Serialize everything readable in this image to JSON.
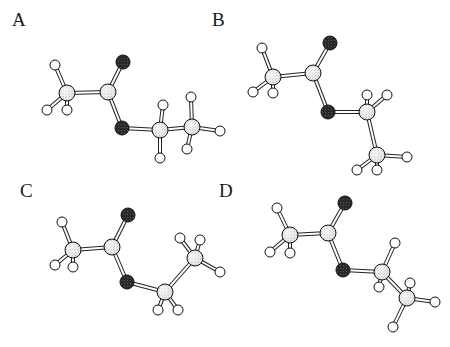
{
  "figure": {
    "colors": {
      "background": "#ffffff",
      "carbon_fill": "#e4e4e4",
      "oxygen_fill": "#222222",
      "hydrogen_fill": "#ffffff",
      "outline": "#111111",
      "bond_outline": "#222222",
      "bond_fill": "#ffffff"
    },
    "panels": [
      {
        "label": "A",
        "label_pos": [
          12,
          10
        ],
        "atoms": [
          {
            "id": "H1",
            "el": "H",
            "x": 55,
            "y": 65
          },
          {
            "id": "H2",
            "el": "H",
            "x": 47,
            "y": 110
          },
          {
            "id": "H3",
            "el": "H",
            "x": 67,
            "y": 110
          },
          {
            "id": "C1",
            "el": "C",
            "x": 67,
            "y": 93
          },
          {
            "id": "C2",
            "el": "C",
            "x": 108,
            "y": 92
          },
          {
            "id": "O1",
            "el": "O",
            "x": 123,
            "y": 62
          },
          {
            "id": "O2",
            "el": "O",
            "x": 122,
            "y": 128
          },
          {
            "id": "C3",
            "el": "C",
            "x": 160,
            "y": 130
          },
          {
            "id": "H4",
            "el": "H",
            "x": 163,
            "y": 105
          },
          {
            "id": "H5",
            "el": "H",
            "x": 160,
            "y": 158
          },
          {
            "id": "C4",
            "el": "C",
            "x": 192,
            "y": 127
          },
          {
            "id": "H6",
            "el": "H",
            "x": 191,
            "y": 97
          },
          {
            "id": "H7",
            "el": "H",
            "x": 220,
            "y": 131
          },
          {
            "id": "H8",
            "el": "H",
            "x": 187,
            "y": 149
          }
        ],
        "bonds": [
          [
            "C1",
            "H1"
          ],
          [
            "C1",
            "H2"
          ],
          [
            "C1",
            "H3"
          ],
          [
            "C1",
            "C2"
          ],
          [
            "C2",
            "O1"
          ],
          [
            "C2",
            "O2"
          ],
          [
            "O2",
            "C3"
          ],
          [
            "C3",
            "H4"
          ],
          [
            "C3",
            "H5"
          ],
          [
            "C3",
            "C4"
          ],
          [
            "C4",
            "H6"
          ],
          [
            "C4",
            "H7"
          ],
          [
            "C4",
            "H8"
          ]
        ]
      },
      {
        "label": "B",
        "label_pos": [
          212,
          10
        ],
        "atoms": [
          {
            "id": "H1",
            "el": "H",
            "x": 262,
            "y": 48
          },
          {
            "id": "H2",
            "el": "H",
            "x": 253,
            "y": 92
          },
          {
            "id": "H3",
            "el": "H",
            "x": 273,
            "y": 93
          },
          {
            "id": "C1",
            "el": "C",
            "x": 273,
            "y": 77
          },
          {
            "id": "C2",
            "el": "C",
            "x": 313,
            "y": 73
          },
          {
            "id": "O1",
            "el": "O",
            "x": 330,
            "y": 43
          },
          {
            "id": "O2",
            "el": "O",
            "x": 328,
            "y": 112
          },
          {
            "id": "H4",
            "el": "H",
            "x": 367,
            "y": 95
          },
          {
            "id": "H5",
            "el": "H",
            "x": 387,
            "y": 95
          },
          {
            "id": "C3",
            "el": "C",
            "x": 367,
            "y": 112
          },
          {
            "id": "C4",
            "el": "C",
            "x": 377,
            "y": 155
          },
          {
            "id": "H6",
            "el": "H",
            "x": 407,
            "y": 157
          },
          {
            "id": "H7",
            "el": "H",
            "x": 357,
            "y": 170
          },
          {
            "id": "H8",
            "el": "H",
            "x": 377,
            "y": 170
          }
        ],
        "bonds": [
          [
            "C1",
            "H1"
          ],
          [
            "C1",
            "H2"
          ],
          [
            "C1",
            "H3"
          ],
          [
            "C1",
            "C2"
          ],
          [
            "C2",
            "O1"
          ],
          [
            "C2",
            "O2"
          ],
          [
            "O2",
            "C3"
          ],
          [
            "C3",
            "H4"
          ],
          [
            "C3",
            "H5"
          ],
          [
            "C3",
            "C4"
          ],
          [
            "C4",
            "H6"
          ],
          [
            "C4",
            "H7"
          ],
          [
            "C4",
            "H8"
          ]
        ]
      },
      {
        "label": "C",
        "label_pos": [
          20,
          181
        ],
        "atoms": [
          {
            "id": "H1",
            "el": "H",
            "x": 62,
            "y": 222
          },
          {
            "id": "H2",
            "el": "H",
            "x": 55,
            "y": 265
          },
          {
            "id": "H3",
            "el": "H",
            "x": 73,
            "y": 267
          },
          {
            "id": "C1",
            "el": "C",
            "x": 73,
            "y": 250
          },
          {
            "id": "C2",
            "el": "C",
            "x": 112,
            "y": 247
          },
          {
            "id": "O1",
            "el": "O",
            "x": 128,
            "y": 215
          },
          {
            "id": "O2",
            "el": "O",
            "x": 127,
            "y": 282
          },
          {
            "id": "C3",
            "el": "C",
            "x": 165,
            "y": 292
          },
          {
            "id": "H4",
            "el": "H",
            "x": 158,
            "y": 310
          },
          {
            "id": "H5",
            "el": "H",
            "x": 178,
            "y": 310
          },
          {
            "id": "H6",
            "el": "H",
            "x": 180,
            "y": 238
          },
          {
            "id": "H7",
            "el": "H",
            "x": 200,
            "y": 240
          },
          {
            "id": "C4",
            "el": "C",
            "x": 195,
            "y": 258
          },
          {
            "id": "H8",
            "el": "H",
            "x": 220,
            "y": 272
          }
        ],
        "bonds": [
          [
            "C1",
            "H1"
          ],
          [
            "C1",
            "H2"
          ],
          [
            "C1",
            "H3"
          ],
          [
            "C1",
            "C2"
          ],
          [
            "C2",
            "O1"
          ],
          [
            "C2",
            "O2"
          ],
          [
            "O2",
            "C3"
          ],
          [
            "C3",
            "H4"
          ],
          [
            "C3",
            "H5"
          ],
          [
            "C3",
            "C4"
          ],
          [
            "C4",
            "H6"
          ],
          [
            "C4",
            "H7"
          ],
          [
            "C4",
            "H8"
          ]
        ]
      },
      {
        "label": "D",
        "label_pos": [
          219,
          181
        ],
        "atoms": [
          {
            "id": "H1",
            "el": "H",
            "x": 277,
            "y": 208
          },
          {
            "id": "H2",
            "el": "H",
            "x": 270,
            "y": 252
          },
          {
            "id": "H3",
            "el": "H",
            "x": 290,
            "y": 253
          },
          {
            "id": "C1",
            "el": "C",
            "x": 290,
            "y": 235
          },
          {
            "id": "C2",
            "el": "C",
            "x": 328,
            "y": 233
          },
          {
            "id": "O1",
            "el": "O",
            "x": 345,
            "y": 203
          },
          {
            "id": "O2",
            "el": "O",
            "x": 343,
            "y": 270
          },
          {
            "id": "H4",
            "el": "H",
            "x": 395,
            "y": 243
          },
          {
            "id": "H5",
            "el": "H",
            "x": 379,
            "y": 287
          },
          {
            "id": "C3",
            "el": "C",
            "x": 382,
            "y": 272
          },
          {
            "id": "H6",
            "el": "H",
            "x": 410,
            "y": 283
          },
          {
            "id": "C4",
            "el": "C",
            "x": 407,
            "y": 298
          },
          {
            "id": "H7",
            "el": "H",
            "x": 435,
            "y": 302
          },
          {
            "id": "H8",
            "el": "H",
            "x": 393,
            "y": 327
          }
        ],
        "bonds": [
          [
            "C1",
            "H1"
          ],
          [
            "C1",
            "H2"
          ],
          [
            "C1",
            "H3"
          ],
          [
            "C1",
            "C2"
          ],
          [
            "C2",
            "O1"
          ],
          [
            "C2",
            "O2"
          ],
          [
            "O2",
            "C3"
          ],
          [
            "C3",
            "H4"
          ],
          [
            "C3",
            "H5"
          ],
          [
            "C3",
            "C4"
          ],
          [
            "C4",
            "H6"
          ],
          [
            "C4",
            "H7"
          ],
          [
            "C4",
            "H8"
          ]
        ]
      }
    ]
  }
}
